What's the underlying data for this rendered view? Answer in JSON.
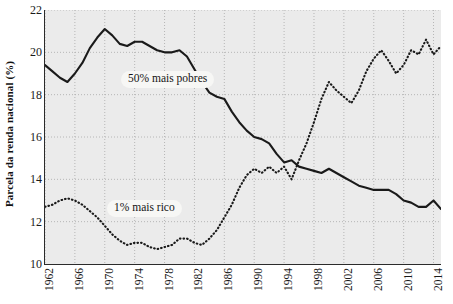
{
  "axes": {
    "ylabel": "Parcela da renda nacional (%)",
    "yticks": [
      10,
      12,
      14,
      16,
      18,
      20,
      22
    ],
    "xticks": [
      1962,
      1966,
      1970,
      1974,
      1978,
      1982,
      1986,
      1990,
      1994,
      1998,
      2002,
      2006,
      2010,
      2014
    ]
  },
  "annotations": {
    "poorest": "50% mais pobres",
    "richest": "1% mais rico"
  },
  "colors": {
    "line": "#1a1a1a",
    "plot_background": "#ebebeb",
    "grid": "#b0b0b0",
    "axis": "#2b2b2b"
  },
  "chart_data": {
    "type": "line",
    "title": "",
    "subtitle": "",
    "xlabel": "",
    "ylabel": "Parcela da renda nacional (%)",
    "xlim": [
      1962,
      2015
    ],
    "ylim": [
      10,
      22
    ],
    "grid": true,
    "legend": "inline-annotations",
    "tick_labels": {
      "x": [
        "1962",
        "1966",
        "1970",
        "1974",
        "1978",
        "1982",
        "1986",
        "1990",
        "1994",
        "1998",
        "2002",
        "2006",
        "2010",
        "2014"
      ],
      "y": [
        "10",
        "12",
        "14",
        "16",
        "18",
        "20",
        "22"
      ]
    },
    "x": [
      1962,
      1963,
      1964,
      1965,
      1966,
      1967,
      1968,
      1969,
      1970,
      1971,
      1972,
      1973,
      1974,
      1975,
      1976,
      1977,
      1978,
      1979,
      1980,
      1981,
      1982,
      1983,
      1984,
      1985,
      1986,
      1987,
      1988,
      1989,
      1990,
      1991,
      1992,
      1993,
      1994,
      1995,
      1996,
      1997,
      1998,
      1999,
      2000,
      2001,
      2002,
      2003,
      2004,
      2005,
      2006,
      2007,
      2008,
      2009,
      2010,
      2011,
      2012,
      2013,
      2014,
      2015
    ],
    "series": [
      {
        "name": "50% mais pobres",
        "label": "50% mais pobres",
        "style": "solid",
        "values": [
          19.4,
          19.1,
          18.8,
          18.6,
          19.0,
          19.5,
          20.2,
          20.7,
          21.1,
          20.8,
          20.4,
          20.3,
          20.5,
          20.5,
          20.3,
          20.1,
          20.0,
          20.0,
          20.1,
          19.8,
          19.2,
          18.6,
          18.1,
          17.9,
          17.8,
          17.2,
          16.7,
          16.3,
          16.0,
          15.9,
          15.7,
          15.2,
          14.8,
          14.9,
          14.6,
          14.5,
          14.4,
          14.3,
          14.5,
          14.3,
          14.1,
          13.9,
          13.7,
          13.6,
          13.5,
          13.5,
          13.5,
          13.3,
          13.0,
          12.9,
          12.7,
          12.7,
          13.0,
          12.6
        ]
      },
      {
        "name": "1% mais rico",
        "label": "1% mais rico",
        "style": "dotted",
        "values": [
          12.7,
          12.8,
          13.0,
          13.1,
          13.0,
          12.8,
          12.5,
          12.2,
          11.8,
          11.4,
          11.1,
          10.9,
          11.0,
          11.0,
          10.8,
          10.7,
          10.8,
          10.9,
          11.2,
          11.2,
          11.0,
          10.9,
          11.2,
          11.6,
          12.2,
          12.8,
          13.6,
          14.2,
          14.5,
          14.3,
          14.6,
          14.3,
          14.6,
          14.0,
          14.9,
          15.7,
          16.7,
          17.8,
          18.6,
          18.2,
          17.9,
          17.6,
          18.2,
          19.1,
          19.7,
          20.1,
          19.6,
          19.0,
          19.4,
          20.1,
          19.9,
          20.6,
          19.9,
          20.3
        ]
      }
    ]
  }
}
